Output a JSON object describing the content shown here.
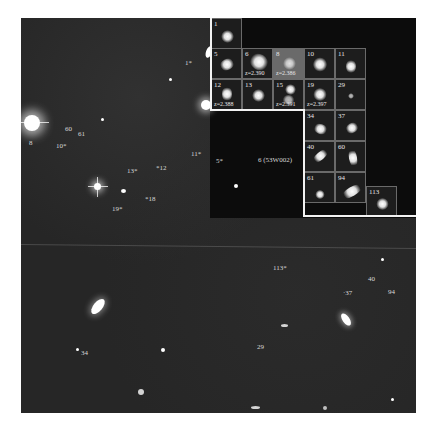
{
  "figure": {
    "type": "deep-field astronomical image with inset cutouts",
    "colors": {
      "page": "#ffffff",
      "sky": "#262626",
      "inset_frame": "#f2f2f2",
      "label": "#d8d8d8"
    }
  },
  "field_labels": [
    {
      "id": "1",
      "text": "1*",
      "x": 185,
      "y": 60
    },
    {
      "id": "8",
      "text": "8",
      "x": 29,
      "y": 140
    },
    {
      "id": "60",
      "text": "60",
      "x": 65,
      "y": 126
    },
    {
      "id": "61",
      "text": "61",
      "x": 78,
      "y": 131
    },
    {
      "id": "10",
      "text": "10*",
      "x": 56,
      "y": 143
    },
    {
      "id": "11",
      "text": "11*",
      "x": 191,
      "y": 151
    },
    {
      "id": "5",
      "text": "5*",
      "x": 216,
      "y": 158
    },
    {
      "id": "6",
      "text": "6 (53W002)",
      "x": 258,
      "y": 157
    },
    {
      "id": "12",
      "text": "*12",
      "x": 156,
      "y": 165
    },
    {
      "id": "13",
      "text": "13*",
      "x": 127,
      "y": 168
    },
    {
      "id": "18",
      "text": "*18",
      "x": 145,
      "y": 196
    },
    {
      "id": "19",
      "text": "19*",
      "x": 112,
      "y": 206
    },
    {
      "id": "113",
      "text": "113*",
      "x": 273,
      "y": 265
    },
    {
      "id": "40",
      "text": "40",
      "x": 368,
      "y": 276
    },
    {
      "id": "37",
      "text": "·37",
      "x": 343,
      "y": 290
    },
    {
      "id": "94",
      "text": "94",
      "x": 388,
      "y": 289
    },
    {
      "id": "34",
      "text": "34",
      "x": 81,
      "y": 350
    },
    {
      "id": "29",
      "text": "29",
      "x": 257,
      "y": 344
    }
  ],
  "inset_cells": [
    {
      "id": "1",
      "redshift": "",
      "col": 0,
      "row": 0
    },
    {
      "id": "5",
      "redshift": "",
      "col": 0,
      "row": 1
    },
    {
      "id": "6",
      "redshift": "z=2.390",
      "col": 1,
      "row": 1
    },
    {
      "id": "8",
      "redshift": "z=2.386",
      "col": 2,
      "row": 1
    },
    {
      "id": "10",
      "redshift": "",
      "col": 3,
      "row": 1
    },
    {
      "id": "11",
      "redshift": "",
      "col": 4,
      "row": 1
    },
    {
      "id": "12",
      "redshift": "z=2.388",
      "col": 0,
      "row": 2
    },
    {
      "id": "13",
      "redshift": "",
      "col": 1,
      "row": 2
    },
    {
      "id": "15",
      "redshift": "z=2.391",
      "col": 2,
      "row": 2
    },
    {
      "id": "19",
      "redshift": "z=2.397",
      "col": 3,
      "row": 2
    },
    {
      "id": "29",
      "redshift": "",
      "col": 4,
      "row": 2
    },
    {
      "id": "34",
      "redshift": "",
      "col": 3,
      "row": 3
    },
    {
      "id": "37",
      "redshift": "",
      "col": 4,
      "row": 3
    },
    {
      "id": "40",
      "redshift": "",
      "col": 3,
      "row": 4
    },
    {
      "id": "60",
      "redshift": "",
      "col": 4,
      "row": 4
    },
    {
      "id": "61",
      "redshift": "",
      "col": 3,
      "row": 5
    },
    {
      "id": "94",
      "redshift": "",
      "col": 4,
      "row": 5
    },
    {
      "id": "113",
      "redshift": "",
      "col": 5,
      "row": 5.45
    }
  ]
}
